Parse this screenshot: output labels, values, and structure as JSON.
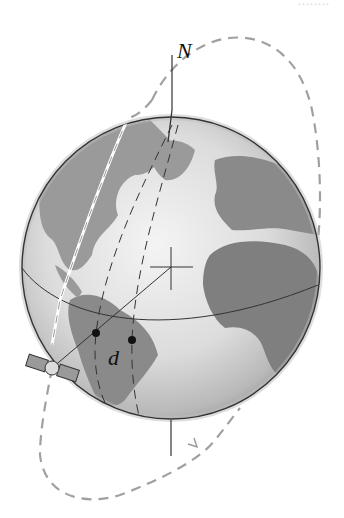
{
  "figure": {
    "labels": {
      "north": "N",
      "distance": "d",
      "top_crop_text": "........"
    },
    "colors": {
      "globe_light": "#e6e6e6",
      "globe_dark": "#a8a8a8",
      "land": "#8c8c8c",
      "outline": "#333333",
      "orbit": "#9a9a9a",
      "point": "#111111"
    }
  }
}
